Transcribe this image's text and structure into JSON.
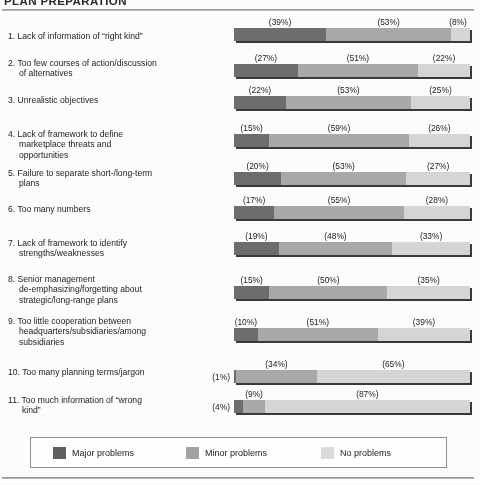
{
  "title": "PLAN PREPARATION",
  "legend": {
    "items": [
      {
        "label": "Major problems",
        "key": "major",
        "color": "#5f5f5f"
      },
      {
        "label": "Minor problems",
        "key": "minor",
        "color": "#a3a3a3"
      },
      {
        "label": "No problems",
        "key": "none",
        "color": "#dcdcdc"
      }
    ]
  },
  "chart_data": {
    "type": "bar",
    "orientation": "horizontal",
    "stacked": true,
    "title": "PLAN PREPARATION",
    "xlabel": "",
    "ylabel": "",
    "xlim": [
      0,
      100
    ],
    "grid": false,
    "legend_position": "bottom",
    "value_suffix": "%",
    "value_format": "(n%)",
    "categories": [
      "1. Lack of information of “right kind”",
      "2. Too few courses of action/discussion of alternatives",
      "3. Unrealistic objectives",
      "4. Lack of framework to define marketplace threats and opportunities",
      "5. Failure to separate short-/long-term plans",
      "6. Too many numbers",
      "7. Lack of framework to identify strengths/weaknesses",
      "8. Senior management de-emphasizing/forgetting about strategic/long-range plans",
      "9. Too little cooperation between headquarters/subsidiaries/among subsidiaries",
      "10. Too many planning terms/jargon",
      "11. Too much information of “wrong kind”"
    ],
    "series": [
      {
        "name": "Major problems",
        "color": "#6d6d6d",
        "values": [
          39,
          27,
          22,
          15,
          20,
          17,
          19,
          15,
          10,
          1,
          4
        ]
      },
      {
        "name": "Minor problems",
        "color": "#a9a9a9",
        "values": [
          53,
          51,
          53,
          59,
          53,
          55,
          48,
          50,
          51,
          34,
          9
        ]
      },
      {
        "name": "No problems",
        "color": "#d6d6d6",
        "values": [
          8,
          22,
          25,
          26,
          27,
          28,
          33,
          35,
          39,
          65,
          87
        ]
      }
    ]
  },
  "rows": [
    {
      "label_lines": [
        "1. Lack of information of “right kind”"
      ],
      "values": [
        39,
        53,
        8
      ],
      "labels": [
        "(39%)",
        "(53%)",
        "(8%)"
      ],
      "first_outside": false
    },
    {
      "label_lines": [
        "2. Too few courses of action/discussion",
        "of alternatives"
      ],
      "values": [
        27,
        51,
        22
      ],
      "labels": [
        "(27%)",
        "(51%)",
        "(22%)"
      ],
      "first_outside": false
    },
    {
      "label_lines": [
        "3. Unrealistic objectives"
      ],
      "values": [
        22,
        53,
        25
      ],
      "labels": [
        "(22%)",
        "(53%)",
        "(25%)"
      ],
      "first_outside": false
    },
    {
      "label_lines": [
        "4. Lack of framework to define",
        "marketplace threats and",
        "opportunities"
      ],
      "values": [
        15,
        59,
        26
      ],
      "labels": [
        "(15%)",
        "(59%)",
        "(26%)"
      ],
      "first_outside": false
    },
    {
      "label_lines": [
        "5. Failure to separate short-/long-term",
        "plans"
      ],
      "values": [
        20,
        53,
        27
      ],
      "labels": [
        "(20%)",
        "(53%)",
        "(27%)"
      ],
      "first_outside": false
    },
    {
      "label_lines": [
        "6. Too many numbers"
      ],
      "values": [
        17,
        55,
        28
      ],
      "labels": [
        "(17%)",
        "(55%)",
        "(28%)"
      ],
      "first_outside": false
    },
    {
      "label_lines": [
        "7. Lack of framework to identify",
        "strengths/weaknesses"
      ],
      "values": [
        19,
        48,
        33
      ],
      "labels": [
        "(19%)",
        "(48%)",
        "(33%)"
      ],
      "first_outside": false
    },
    {
      "label_lines": [
        "8. Senior management",
        "de-emphasizing/forgetting about",
        "strategic/long-range plans"
      ],
      "values": [
        15,
        50,
        35
      ],
      "labels": [
        "(15%)",
        "(50%)",
        "(35%)"
      ],
      "first_outside": false
    },
    {
      "label_lines": [
        "9. Too little cooperation between",
        "headquarters/subsidiaries/among",
        "subsidiaries"
      ],
      "values": [
        10,
        51,
        39
      ],
      "labels": [
        "(10%)",
        "(51%)",
        "(39%)"
      ],
      "first_outside": false
    },
    {
      "label_lines": [
        "10. Too many planning terms/jargon"
      ],
      "values": [
        1,
        34,
        65
      ],
      "labels": [
        "(1%)",
        "(34%)",
        "(65%)"
      ],
      "first_outside": true
    },
    {
      "label_lines": [
        "11. Too much information of “wrong",
        "kind”"
      ],
      "values": [
        4,
        9,
        87
      ],
      "labels": [
        "(4%)",
        "(9%)",
        "(87%)"
      ],
      "first_outside": true
    }
  ]
}
